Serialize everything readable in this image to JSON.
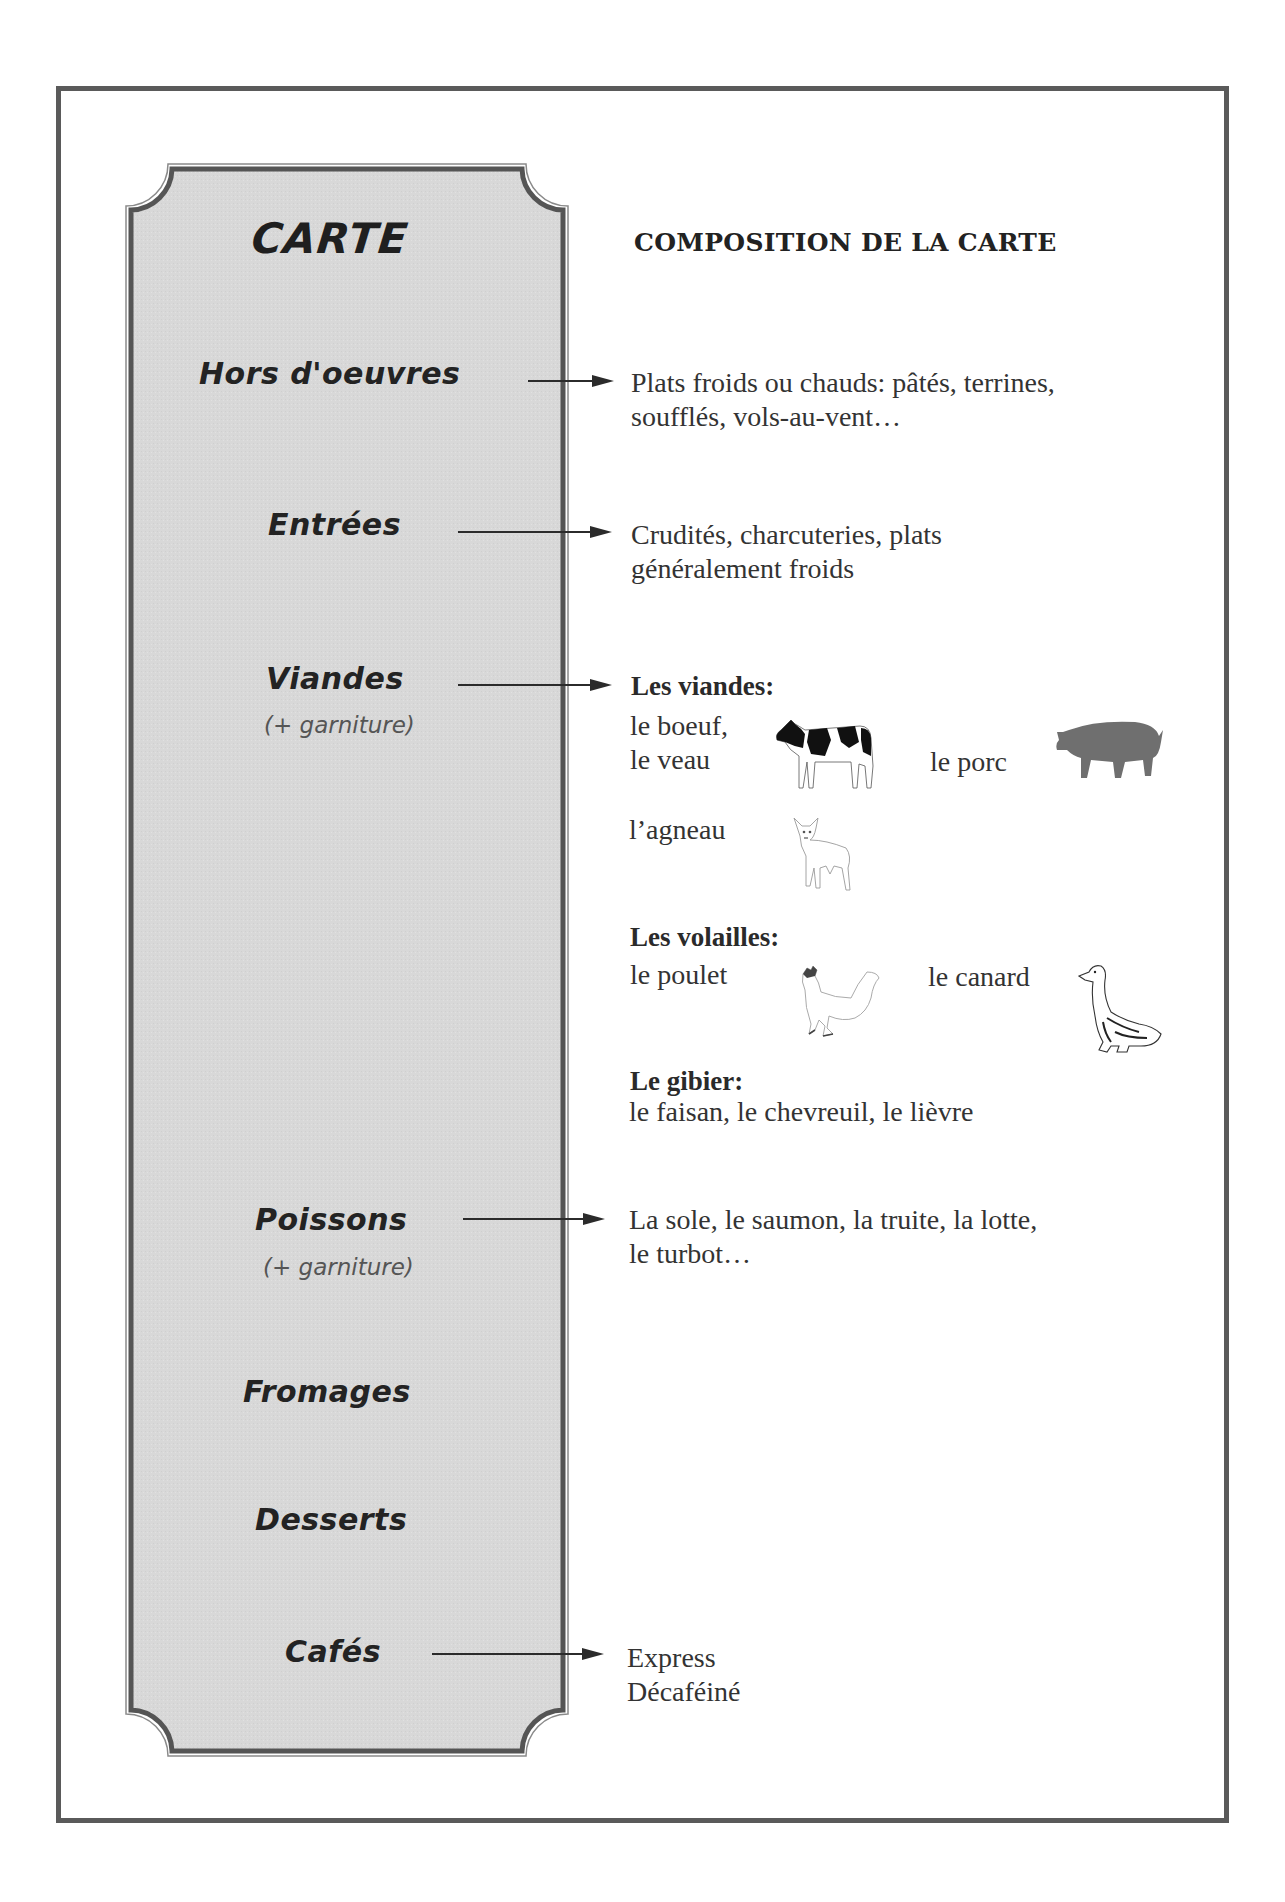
{
  "menu": {
    "title": "CARTE",
    "courses": [
      {
        "label": "Hors d'oeuvres",
        "note": null
      },
      {
        "label": "Entrées",
        "note": null
      },
      {
        "label": "Viandes",
        "note": "(+ garniture)"
      },
      {
        "label": "Poissons",
        "note": "(+ garniture)"
      },
      {
        "label": "Fromages",
        "note": null
      },
      {
        "label": "Desserts",
        "note": null
      },
      {
        "label": "Cafés",
        "note": null
      }
    ]
  },
  "composition": {
    "heading": "COMPOSITION DE LA CARTE",
    "hors_doeuvres": {
      "line1": "Plats froids ou chauds: pâtés, terrines,",
      "line2": "soufflés, vols-au-vent…"
    },
    "entrees": {
      "line1": "Crudités, charcuteries, plats",
      "line2": "généralement froids"
    },
    "viandes": {
      "heading": "Les viandes:",
      "items": {
        "boeuf": "le boeuf,",
        "veau": "le veau",
        "porc": "le porc",
        "agneau": "l’agneau"
      },
      "icons": [
        "cow-icon",
        "pig-icon",
        "lamb-icon"
      ]
    },
    "volailles": {
      "heading": "Les volailles:",
      "items": {
        "poulet": "le poulet",
        "canard": "le canard"
      },
      "icons": [
        "rooster-icon",
        "duck-icon"
      ]
    },
    "gibier": {
      "heading": "Le gibier:",
      "line": "le faisan, le chevreuil, le lièvre"
    },
    "poissons": {
      "line1": "La sole, le saumon, la truite, la lotte,",
      "line2": "le turbot…"
    },
    "cafes": {
      "line1": "Express",
      "line2": "Décaféiné"
    }
  },
  "colors": {
    "frame": "#5a5a5a",
    "panel_fill": "#d9d9d9",
    "panel_border": "#555555",
    "text": "#333333",
    "pig": "#6f6f6f"
  }
}
